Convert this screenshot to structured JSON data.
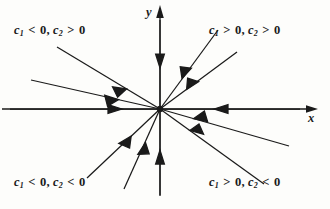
{
  "figure": {
    "type": "phase-portrait",
    "origin": {
      "x": 160,
      "y": 109
    },
    "stroke_color": "#1a1a1a",
    "background_color": "#fdfdfb"
  },
  "axes": {
    "x": {
      "label": "x",
      "label_x": 308,
      "label_y": 111,
      "line": {
        "x1": 2,
        "y1": 109,
        "x2": 316,
        "y2": 109
      },
      "arrow_tip": {
        "x": 318,
        "y": 109
      }
    },
    "y": {
      "label": "y",
      "label_x": 146,
      "label_y": 5,
      "line": {
        "x1": 160,
        "y1": 6,
        "x2": 160,
        "y2": 196
      },
      "arrow_tip": {
        "x": 160,
        "y": 5
      }
    }
  },
  "quadrant_labels": [
    {
      "id": "q2",
      "c1_sign": "<",
      "c2_sign": ">",
      "text": "c1 < 0, c2 > 0",
      "x": 14,
      "y": 23
    },
    {
      "id": "q1",
      "c1_sign": ">",
      "c2_sign": ">",
      "text": "c1 > 0, c2 > 0",
      "x": 209,
      "y": 23
    },
    {
      "id": "q3",
      "c1_sign": "<",
      "c2_sign": "<",
      "text": "c1 < 0, c2 < 0",
      "x": 14,
      "y": 175
    },
    {
      "id": "q4",
      "c1_sign": ">",
      "c2_sign": "<",
      "text": "c1 > 0, c2 < 0",
      "x": 209,
      "y": 175
    }
  ],
  "symbols": {
    "c": "c",
    "sub1": "1",
    "sub2": "2",
    "zero": "0",
    "comma": ",",
    "less_than": "<",
    "greater_than": ">"
  },
  "trajectories": [
    {
      "id": "q2-steep",
      "quadrant": 2,
      "from": {
        "x": 57,
        "y": 47
      },
      "to": {
        "x": 160,
        "y": 109
      },
      "arrow_at": 0.66,
      "direction": "inward"
    },
    {
      "id": "q2-shallow",
      "quadrant": 2,
      "from": {
        "x": 31,
        "y": 80
      },
      "to": {
        "x": 160,
        "y": 109
      },
      "arrow_at": 0.68,
      "direction": "inward"
    },
    {
      "id": "q1-steep",
      "quadrant": 1,
      "from": {
        "x": 218,
        "y": 30
      },
      "to": {
        "x": 160,
        "y": 109
      },
      "arrow_at": 0.62,
      "direction": "inward"
    },
    {
      "id": "q1-shallow",
      "quadrant": 1,
      "from": {
        "x": 237,
        "y": 52
      },
      "to": {
        "x": 160,
        "y": 109
      },
      "arrow_at": 0.65,
      "direction": "inward"
    },
    {
      "id": "q3-steep",
      "quadrant": 3,
      "from": {
        "x": 124,
        "y": 189
      },
      "to": {
        "x": 160,
        "y": 109
      },
      "arrow_at": 0.58,
      "direction": "inward"
    },
    {
      "id": "q3-shallow",
      "quadrant": 3,
      "from": {
        "x": 87,
        "y": 178
      },
      "to": {
        "x": 160,
        "y": 109
      },
      "arrow_at": 0.6,
      "direction": "inward"
    },
    {
      "id": "q4-steep",
      "quadrant": 4,
      "from": {
        "x": 264,
        "y": 184
      },
      "to": {
        "x": 160,
        "y": 109
      },
      "arrow_at": 0.67,
      "direction": "inward"
    },
    {
      "id": "q4-shallow",
      "quadrant": 4,
      "from": {
        "x": 289,
        "y": 146
      },
      "to": {
        "x": 160,
        "y": 109
      },
      "arrow_at": 0.69,
      "direction": "inward"
    },
    {
      "id": "axis-neg-x",
      "quadrant": 0,
      "from": {
        "x": 10,
        "y": 109
      },
      "to": {
        "x": 160,
        "y": 109
      },
      "arrow_at": 0.7,
      "direction": "inward"
    },
    {
      "id": "axis-pos-x",
      "quadrant": 0,
      "from": {
        "x": 300,
        "y": 109
      },
      "to": {
        "x": 160,
        "y": 109
      },
      "arrow_at": 0.6,
      "direction": "inward"
    },
    {
      "id": "axis-pos-y",
      "quadrant": 0,
      "from": {
        "x": 160,
        "y": 20
      },
      "to": {
        "x": 160,
        "y": 109
      },
      "arrow_at": 0.55,
      "direction": "inward"
    },
    {
      "id": "axis-neg-y",
      "quadrant": 0,
      "from": {
        "x": 160,
        "y": 195
      },
      "to": {
        "x": 160,
        "y": 109
      },
      "arrow_at": 0.52,
      "direction": "inward"
    }
  ]
}
